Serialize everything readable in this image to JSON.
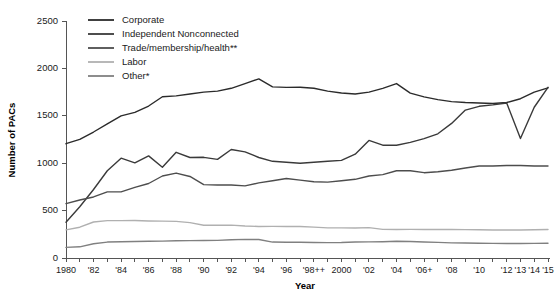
{
  "chart_data": {
    "type": "line",
    "title": "",
    "xlabel": "Year",
    "ylabel": "Number of PACs",
    "xlim": [
      1980,
      2015
    ],
    "ylim": [
      0,
      2500
    ],
    "yticks": [
      0,
      500,
      1000,
      1500,
      2000,
      2500
    ],
    "ytick_labels": [
      "0",
      "500",
      "1000",
      "1500",
      "2000",
      "2500"
    ],
    "x": [
      1980,
      1981,
      1982,
      1983,
      1984,
      1985,
      1986,
      1987,
      1988,
      1989,
      1990,
      1991,
      1992,
      1993,
      1994,
      1995,
      1996,
      1997,
      1998,
      1999,
      2000,
      2001,
      2002,
      2003,
      2004,
      2005,
      2006,
      2007,
      2008,
      2009,
      2010,
      2011,
      2012,
      2013,
      2014,
      2015
    ],
    "xtick_labels": [
      "1980",
      "",
      "'82",
      "",
      "'84",
      "",
      "'86",
      "",
      "'88",
      "",
      "'90",
      "",
      "'92",
      "",
      "'94",
      "",
      "'96",
      "",
      "'98++",
      "",
      "2000",
      "",
      "'02",
      "",
      "'04",
      "",
      "'06+",
      "",
      "'08",
      "",
      "'10",
      "",
      "'12",
      "'13",
      "'14",
      "'15"
    ],
    "grid": false,
    "legend_position": "top-left",
    "series": [
      {
        "name": "Corporate",
        "color": "#2b2b2b",
        "values": [
          1206,
          1251,
          1329,
          1415,
          1499,
          1536,
          1603,
          1701,
          1710,
          1730,
          1750,
          1760,
          1790,
          1840,
          1890,
          1805,
          1800,
          1801,
          1790,
          1760,
          1740,
          1730,
          1750,
          1790,
          1840,
          1740,
          1700,
          1670,
          1650,
          1640,
          1635,
          1630,
          1640,
          1680,
          1750,
          1795
        ]
      },
      {
        "name": "Independent Nonconnected",
        "color": "#3a3a3a",
        "values": [
          378,
          540,
          723,
          920,
          1053,
          1003,
          1077,
          957,
          1115,
          1060,
          1062,
          1040,
          1145,
          1120,
          1060,
          1020,
          1010,
          1000,
          1010,
          1020,
          1030,
          1095,
          1240,
          1190,
          1190,
          1220,
          1260,
          1310,
          1420,
          1560,
          1600,
          1615,
          1635,
          1260,
          1590,
          1800
        ]
      },
      {
        "name": "Trade/membership/health**",
        "color": "#4d4d4d",
        "values": [
          574,
          612,
          644,
          698,
          698,
          745,
          786,
          865,
          896,
          860,
          774,
          770,
          770,
          761,
          792,
          815,
          838,
          821,
          805,
          800,
          815,
          830,
          865,
          880,
          920,
          920,
          900,
          910,
          925,
          950,
          970,
          970,
          975,
          975,
          970,
          970
        ]
      },
      {
        "name": "Labor",
        "color": "#b0b0b0",
        "values": [
          297,
          325,
          380,
          394,
          394,
          396,
          391,
          389,
          386,
          373,
          346,
          345,
          347,
          337,
          333,
          334,
          332,
          332,
          326,
          318,
          318,
          317,
          320,
          302,
          301,
          302,
          300,
          300,
          300,
          299,
          298,
          296,
          296,
          296,
          298,
          300
        ]
      },
      {
        "name": "Other*",
        "color": "#808080",
        "values": [
          112,
          118,
          150,
          168,
          172,
          174,
          176,
          178,
          182,
          183,
          185,
          186,
          193,
          196,
          195,
          168,
          166,
          166,
          164,
          162,
          163,
          168,
          170,
          172,
          176,
          174,
          168,
          165,
          160,
          158,
          156,
          154,
          153,
          153,
          154,
          155
        ]
      }
    ]
  },
  "legend": {
    "items": [
      {
        "label": "Corporate",
        "color": "#2b2b2b"
      },
      {
        "label": "Independent Nonconnected",
        "color": "#3a3a3a"
      },
      {
        "label": "Trade/membership/health**",
        "color": "#4d4d4d"
      },
      {
        "label": "Labor",
        "color": "#b0b0b0"
      },
      {
        "label": "Other*",
        "color": "#808080"
      }
    ]
  },
  "axes": {
    "x_title": "Year",
    "y_title": "Number of PACs"
  }
}
